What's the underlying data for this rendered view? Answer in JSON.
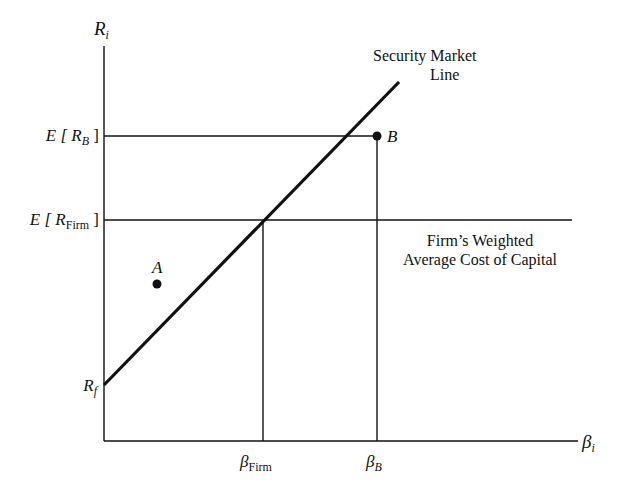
{
  "diagram": {
    "type": "security-market-line-wacc",
    "y_axis": {
      "symbol": "R",
      "subscript": "i"
    },
    "x_axis": {
      "symbol": "β",
      "subscript": "i"
    },
    "y_ticks": [
      {
        "prefix": "E [ ",
        "symbol": "R",
        "subscript": "B",
        "suffix": " ]"
      },
      {
        "prefix": "E [ ",
        "symbol": "R",
        "subscript": "Firm",
        "suffix": " ]"
      },
      {
        "symbol": "R",
        "subscript": "f"
      }
    ],
    "x_ticks": [
      {
        "symbol": "β",
        "subscript": "Firm"
      },
      {
        "symbol": "β",
        "subscript": "B"
      }
    ],
    "sml_label": {
      "line1": "Security Market",
      "line2": "Line"
    },
    "wacc_label": {
      "line1": "Firm’s Weighted",
      "line2": "Average Cost of Capital"
    },
    "points": [
      {
        "name": "A"
      },
      {
        "name": "B"
      }
    ],
    "colors": {
      "ink": "#111111",
      "background": "#ffffff"
    }
  }
}
